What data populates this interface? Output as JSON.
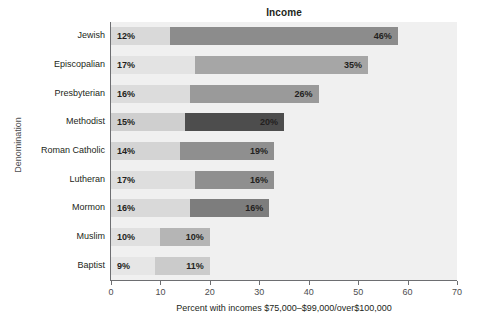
{
  "chart": {
    "title": "Income",
    "ylabel": "Denomination",
    "xlabel": "Percent with incomes $75,000–$99,000/over$100,000"
  },
  "axis": {
    "ticks": [
      "0",
      "10",
      "20",
      "30",
      "40",
      "50",
      "60",
      "70"
    ]
  },
  "chart_data": {
    "type": "bar",
    "orientation": "horizontal",
    "stacked": true,
    "title": "Income",
    "xlabel": "Percent with incomes $75,000–$99,000/over$100,000",
    "ylabel": "Denomination",
    "xlim": [
      0,
      70
    ],
    "grid": false,
    "legend": "none",
    "categories": [
      "Jewish",
      "Episcopalian",
      "Presbyterian",
      "Methodist",
      "Roman Catholic",
      "Lutheran",
      "Mormon",
      "Muslim",
      "Baptist"
    ],
    "series": [
      {
        "name": "$75,000–$99,000",
        "values": [
          12,
          17,
          16,
          15,
          14,
          17,
          16,
          10,
          9
        ],
        "labels": [
          "12%",
          "17%",
          "16%",
          "15%",
          "14%",
          "17%",
          "16%",
          "10%",
          "9%"
        ]
      },
      {
        "name": "over $100,000",
        "values": [
          46,
          35,
          26,
          20,
          19,
          16,
          16,
          10,
          11
        ],
        "labels": [
          "46%",
          "35%",
          "26%",
          "20%",
          "19%",
          "16%",
          "16%",
          "10%",
          "11%"
        ]
      }
    ],
    "colors": {
      "plot_background": "#f0f0f0",
      "segment1_fills": [
        "#d9d9d9",
        "#e3e3e3",
        "#dcdcdc",
        "#cfcfcf",
        "#d4d4d4",
        "#dedede",
        "#d9d9d9",
        "#e0e0e0",
        "#e6e6e6"
      ],
      "segment2_fills": [
        "#8c8c8c",
        "#a6a6a6",
        "#9a9a9a",
        "#4d4d4d",
        "#8f8f8f",
        "#8f8f8f",
        "#7d7d7d",
        "#b5b5b5",
        "#cbcbcb"
      ],
      "axis": "#6d6e71",
      "text": "#231f20"
    }
  }
}
